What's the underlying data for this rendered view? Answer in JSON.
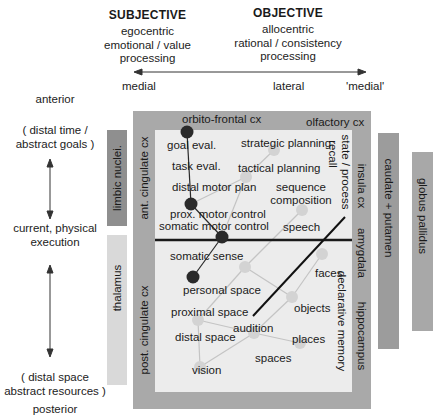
{
  "header": {
    "subjective": {
      "title": "SUBJECTIVE",
      "line1": "egocentric",
      "line2": "emotional / value",
      "line3": "processing"
    },
    "objective": {
      "title": "OBJECTIVE",
      "line1": "allocentric",
      "line2": "rational / consistency",
      "line3": "processing"
    }
  },
  "horizontal_axis": {
    "left": "medial",
    "middle": "lateral",
    "right": "'medial'"
  },
  "vertical_axis": {
    "top": "anterior",
    "upper_line1": "( distal time /",
    "upper_line2": "abstract goals )",
    "middle_line1": "current, physical",
    "middle_line2": "execution",
    "lower_line1": "( distal space",
    "lower_line2": "abstract resources )",
    "bottom": "posterior"
  },
  "side_structures": {
    "limbic_nuclei": "limbic nuclei.",
    "thalamus": "thalamus",
    "caudate_putamen": "caudate + putamen",
    "globus_pallidus": "globus pallidus"
  },
  "frame_labels": {
    "top_left": "orbito-frontal cx",
    "top_right": "olfactory cx",
    "left_upper": "ant. cingulate cx",
    "left_lower": "post. cingulate cx",
    "right_upper": "insula cx",
    "right_middle": "amygdala",
    "right_lower": "hippocampus"
  },
  "inner_labels": {
    "state_process": "state / process",
    "recall": "recall",
    "declarative_memory": "declarative memory"
  },
  "functions": {
    "goal_eval": "goal eval.",
    "task_eval": "task eval.",
    "distal_motor_plan": "distal motor plan",
    "prox_motor_control": "prox. motor control",
    "somatic_motor_control": "somatic motor control",
    "strategic_planning": "strategic planning",
    "tactical_planning": "tactical planning",
    "sequence": "sequence",
    "composition": "composition",
    "speech": "speech",
    "somatic_sense": "somatic sense",
    "personal_space": "personal space",
    "proximal_space": "proximal space",
    "distal_space": "distal space",
    "audition": "audition",
    "vision": "vision",
    "spaces": "spaces",
    "faces": "faces",
    "objects": "objects",
    "places": "places"
  },
  "colors": {
    "outer_frame": "#a9a9a9",
    "inner_panel": "#ececec",
    "limbic_bar": "#8f8f8f",
    "thalamus_bar": "#d9d9d9",
    "caudate_bar": "#9c9c9c",
    "globus_bar": "#a8a8a8",
    "dark_node": "#2a2a2a",
    "light_node": "#d3d3d3",
    "link": "#c4c4c4"
  }
}
